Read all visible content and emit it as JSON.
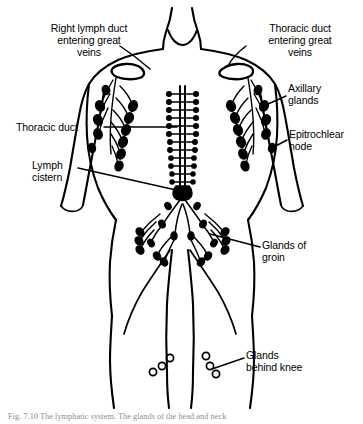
{
  "figure": {
    "background_color": "#ffffff",
    "ink_color": "#000000",
    "caption": "Fig. 7.10 The lymphatic system. The glands of the head and neck"
  },
  "labels": [
    {
      "id": "right-lymph-duct",
      "text": "Right lymph duct\nentering great\nveins",
      "align": "center",
      "x": 24,
      "y": 22,
      "width": 130
    },
    {
      "id": "thoracic-duct-entering-great-veins",
      "text": "Thoracic duct\nentering great\nveins",
      "align": "center",
      "x": 244,
      "y": 22,
      "width": 112
    },
    {
      "id": "axillary-glands",
      "text": "Axillary\nglands",
      "align": "left",
      "x": 288,
      "y": 82,
      "width": 70
    },
    {
      "id": "thoracic-duct",
      "text": "Thoracic duct",
      "align": "left",
      "x": 16,
      "y": 122,
      "width": 86
    },
    {
      "id": "epitrochlear-node",
      "text": "Epitrochlear\nnode",
      "align": "left",
      "x": 289,
      "y": 128,
      "width": 72
    },
    {
      "id": "lymph-cistern",
      "text": "Lymph\ncistern",
      "align": "left",
      "x": 32,
      "y": 160,
      "width": 60
    },
    {
      "id": "glands-of-groin",
      "text": "Glands of\ngroin",
      "align": "left",
      "x": 262,
      "y": 240,
      "width": 80
    },
    {
      "id": "glands-behind-knee",
      "text": "Glands\nbehind knee",
      "align": "left",
      "x": 246,
      "y": 350,
      "width": 90
    }
  ],
  "anatomy": {
    "node_style_filled": "solid black teardrop nodes",
    "node_style_hollow": "open circle nodes at knee",
    "regions": [
      "neck",
      "shoulders",
      "right-axilla",
      "left-axilla",
      "central-thoracic-duct",
      "lymph-cistern",
      "pelvis-groin",
      "legs",
      "knees"
    ]
  }
}
